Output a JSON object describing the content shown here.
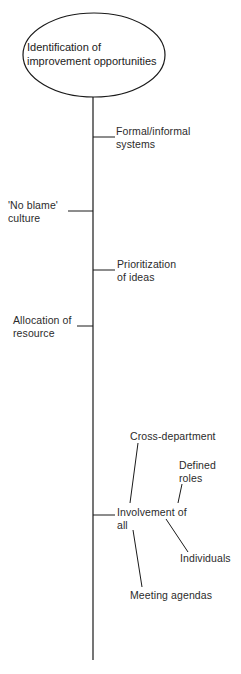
{
  "diagram": {
    "type": "fishbone-tree",
    "root": {
      "line1": "Identification of",
      "line2": "improvement opportunities"
    },
    "branches": [
      {
        "side": "right",
        "line1": "Formal/informal",
        "line2": "systems"
      },
      {
        "side": "left",
        "line1": "'No blame'",
        "line2": "culture"
      },
      {
        "side": "right",
        "line1": "Prioritization",
        "line2": "of ideas"
      },
      {
        "side": "left",
        "line1": "Allocation of",
        "line2": "resource"
      },
      {
        "side": "right",
        "line1": "Involvement of",
        "line2": "all",
        "children": [
          {
            "label": "Cross-department"
          },
          {
            "line1": "Defined",
            "line2": "roles"
          },
          {
            "label": "Individuals"
          },
          {
            "label": "Meeting agendas"
          }
        ]
      }
    ]
  },
  "colors": {
    "line": "#1a1a1a",
    "text": "#2b2b2b",
    "background": "#ffffff"
  }
}
